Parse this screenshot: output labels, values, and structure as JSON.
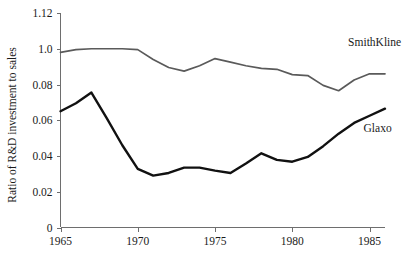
{
  "chart_data": {
    "type": "line",
    "title": "",
    "xlabel": "",
    "ylabel": "Ratio of R&D investment to sales",
    "xlim": [
      1965,
      1986
    ],
    "ylim": [
      0,
      0.12
    ],
    "grid": false,
    "legend_position": "inline-right",
    "x_tick_labels": [
      "1965",
      "1970",
      "1975",
      "1980",
      "1985"
    ],
    "x_tick_values": [
      1965,
      1970,
      1975,
      1980,
      1985
    ],
    "y_tick_labels": [
      "0",
      "0.02",
      "0.04",
      "0.06",
      "0.08",
      "1.0",
      "1.12"
    ],
    "y_tick_values": [
      0,
      0.02,
      0.04,
      0.06,
      0.08,
      0.1,
      0.12
    ],
    "x": [
      1965,
      1966,
      1967,
      1968,
      1969,
      1970,
      1971,
      1972,
      1973,
      1974,
      1975,
      1976,
      1977,
      1978,
      1979,
      1980,
      1981,
      1982,
      1983,
      1984,
      1985,
      1986
    ],
    "series": [
      {
        "name": "SmithKline",
        "color": "#5a5a5a",
        "values": [
          0.098,
          0.0995,
          0.1,
          0.1,
          0.1,
          0.0995,
          0.094,
          0.0895,
          0.0875,
          0.0905,
          0.0945,
          0.0925,
          0.0905,
          0.089,
          0.0885,
          0.0855,
          0.085,
          0.0795,
          0.0765,
          0.0825,
          0.086,
          0.086
        ],
        "label_x": 1984,
        "label_y": 0.104
      },
      {
        "name": "Glaxo",
        "color": "#111111",
        "values": [
          0.065,
          0.0695,
          0.0755,
          0.061,
          0.046,
          0.0328,
          0.029,
          0.0305,
          0.0335,
          0.0335,
          0.0318,
          0.0305,
          0.0358,
          0.0415,
          0.0378,
          0.0368,
          0.0395,
          0.0455,
          0.0525,
          0.0585,
          0.0625,
          0.0665
        ],
        "label_x": 1985,
        "label_y": 0.0555
      }
    ]
  },
  "axis": {
    "y_title": "Ratio of R&D investment to sales"
  },
  "labels": {
    "smithkline": "SmithKline",
    "glaxo": "Glaxo",
    "y0": "0",
    "y1": "0.02",
    "y2": "0.04",
    "y3": "0.06",
    "y4": "0.08",
    "y5": "1.0",
    "y6": "1.12",
    "x0": "1965",
    "x1": "1970",
    "x2": "1975",
    "x3": "1980",
    "x4": "1985"
  }
}
